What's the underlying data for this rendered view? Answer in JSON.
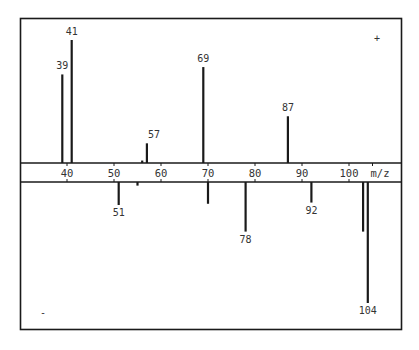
{
  "chart_data": {
    "type": "bar",
    "title": "",
    "xlabel": "m/z",
    "ylabel": "",
    "subtype": "mirrored mass spectrum (stick plot)",
    "xlim": [
      34,
      107
    ],
    "xticks": [
      40,
      50,
      60,
      70,
      80,
      90,
      100
    ],
    "grid": false,
    "legend": null,
    "panels": [
      {
        "name": "positive",
        "symbol": "+",
        "direction": "up",
        "peaks": [
          {
            "mz": 39,
            "intensity": 72,
            "label": "39"
          },
          {
            "mz": 41,
            "intensity": 100,
            "label": "41"
          },
          {
            "mz": 56,
            "intensity": 2,
            "label": ""
          },
          {
            "mz": 57,
            "intensity": 16,
            "label": "57"
          },
          {
            "mz": 69,
            "intensity": 78,
            "label": "69"
          },
          {
            "mz": 87,
            "intensity": 38,
            "label": "87"
          }
        ]
      },
      {
        "name": "negative",
        "symbol": "-",
        "direction": "down",
        "peaks": [
          {
            "mz": 51,
            "intensity": 19,
            "label": "51"
          },
          {
            "mz": 55,
            "intensity": 3,
            "label": ""
          },
          {
            "mz": 70,
            "intensity": 18,
            "label": ""
          },
          {
            "mz": 78,
            "intensity": 41,
            "label": "78"
          },
          {
            "mz": 92,
            "intensity": 17,
            "label": "92"
          },
          {
            "mz": 103,
            "intensity": 41,
            "label": ""
          },
          {
            "mz": 104,
            "intensity": 100,
            "label": "104"
          }
        ]
      }
    ]
  },
  "labels": {
    "axis_unit": "m/z",
    "positive_symbol": "+",
    "negative_symbol": "-"
  },
  "colors": {
    "ink": "#1a1a1a",
    "text": "#333333",
    "background": "#ffffff"
  }
}
